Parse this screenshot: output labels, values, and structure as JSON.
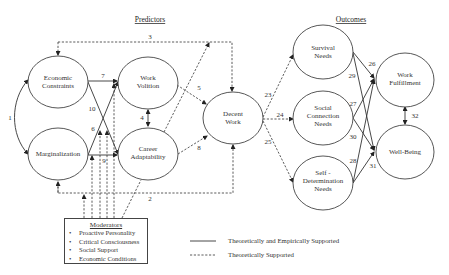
{
  "headers": {
    "predictors": "Predictors",
    "outcomes": "Outcomes"
  },
  "nodes": {
    "economic_constraints": [
      "Economic",
      "Constraints"
    ],
    "marginalization": [
      "Marginalization"
    ],
    "work_volition": [
      "Work",
      "Volition"
    ],
    "career_adaptability": [
      "Career",
      "Adaptability"
    ],
    "decent_work": [
      "Decent",
      "Work"
    ],
    "survival_needs": [
      "Survival",
      "Needs"
    ],
    "social_connection_needs": [
      "Social",
      "Connection",
      "Needs"
    ],
    "self_determination_needs": [
      "Self -",
      "Determination",
      "Needs"
    ],
    "work_fulfillment": [
      "Work",
      "Fulfillment"
    ],
    "well_being": [
      "Well-Being"
    ]
  },
  "paths": {
    "p1": "1",
    "p2": "2",
    "p3": "3",
    "p4": "4",
    "p5": "5",
    "p6": "6",
    "p7": "7",
    "p8": "8",
    "p9": "9",
    "p10": "10",
    "p23": "23",
    "p24": "24",
    "p25": "25",
    "p26": "26",
    "p27": "27",
    "p28": "28",
    "p29": "29",
    "p30": "30",
    "p31": "31",
    "p32": "32"
  },
  "moderators": {
    "title": "Moderators",
    "items": [
      "Proactive Personality",
      "Critical Consciousness",
      "Social Support",
      "Economic Conditions"
    ],
    "bullet": "•"
  },
  "legend": {
    "solid": "Theoretically and Empirically Supported",
    "dashed": "Theoretically Supported"
  }
}
